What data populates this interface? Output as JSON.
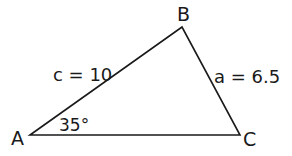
{
  "diagram": {
    "type": "triangle",
    "vertices": [
      {
        "id": "A",
        "label": "A",
        "x": 30,
        "y": 135
      },
      {
        "id": "B",
        "label": "B",
        "x": 182,
        "y": 27
      },
      {
        "id": "C",
        "label": "C",
        "x": 240,
        "y": 135
      }
    ],
    "sides": [
      {
        "id": "c",
        "between": [
          "A",
          "B"
        ],
        "label": "c = 10"
      },
      {
        "id": "a",
        "between": [
          "B",
          "C"
        ],
        "label": "a = 6.5"
      },
      {
        "id": "b",
        "between": [
          "A",
          "C"
        ],
        "label": ""
      }
    ],
    "angles": [
      {
        "at": "A",
        "label": "35°"
      }
    ],
    "stroke_color": "#1a1a1a",
    "background": "#ffffff"
  }
}
